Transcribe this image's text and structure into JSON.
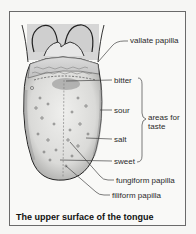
{
  "figure": {
    "caption": "The upper surface of the tongue"
  },
  "labels": {
    "vallate_papilla": "vallate papilla",
    "bitter": "bitter",
    "sour": "sour",
    "salt": "salt",
    "sweet": "sweet",
    "areas_for": "areas for",
    "taste": "taste",
    "fungiform_papilla": "fungiform papilla",
    "filiform_papilla": "filiform papilla"
  },
  "taste_group": {
    "label_line1": "areas for",
    "label_line2": "taste",
    "members": [
      "bitter",
      "sour",
      "salt",
      "sweet"
    ]
  },
  "colors": {
    "frame_border": "#6a6a6a",
    "line": "#444444",
    "tongue_shade": "#d8d8d6",
    "epiglottis_fill": "#c9c9c9"
  }
}
